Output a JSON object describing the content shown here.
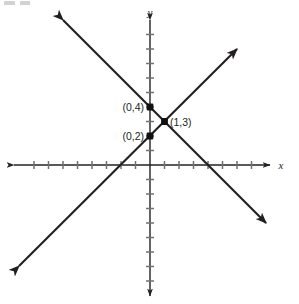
{
  "figure": {
    "kind": "coordinate-plane-graph",
    "width": 299,
    "height": 304,
    "background_color": "#ffffff",
    "line_color": "#231f20",
    "axis_color": "#222222",
    "tick_color": "#6f7173",
    "point_color": "#111111"
  },
  "axes": {
    "x_label": "x",
    "y_label": "y",
    "origin_px": {
      "x": 150,
      "y": 165
    },
    "unit_px": 14.5,
    "x_axis": {
      "pixel_start": 14,
      "pixel_end": 270,
      "tick_count_negative": 9,
      "tick_count_positive": 8,
      "arrows": "both"
    },
    "y_axis": {
      "pixel_start": 20,
      "pixel_end": 296,
      "tick_count_positive": 9,
      "tick_count_negative": 9,
      "arrows": "both"
    },
    "tick_half_length": 4,
    "gridlines": false,
    "tick_labels_shown": false
  },
  "chart_data": {
    "type": "line",
    "title": "",
    "xlabel": "x",
    "ylabel": "y",
    "xlim": [
      -9.4,
      8.3
    ],
    "ylim": [
      -9.6,
      10.0
    ],
    "grid": false,
    "legend": "none",
    "series": [
      {
        "name": "line-increasing",
        "slope": 1,
        "intercept": 2,
        "equation": "y = x + 2",
        "points": [
          [
            -9,
            -7
          ],
          [
            6,
            8
          ]
        ],
        "x": [
          -9,
          6
        ],
        "values": [
          -7,
          8
        ],
        "arrows": [
          "lower-left",
          "upper-right"
        ],
        "x_intercept": -2
      },
      {
        "name": "line-decreasing",
        "slope": -1,
        "intercept": 4,
        "equation": "y = -x + 4",
        "points": [
          [
            -6,
            10
          ],
          [
            8,
            -4
          ]
        ],
        "x": [
          -6,
          8
        ],
        "values": [
          10,
          -4
        ],
        "arrows": [
          "upper-left",
          "lower-right"
        ],
        "x_intercept": 4
      }
    ],
    "annotations": [
      {
        "label": "(0,4)",
        "x": 0,
        "y": 4,
        "text_anchor": "end"
      },
      {
        "label": "(0,2)",
        "x": 0,
        "y": 2,
        "text_anchor": "end"
      },
      {
        "label": "(1,3)",
        "x": 1,
        "y": 3,
        "text_anchor": "start"
      }
    ]
  },
  "points": [
    {
      "id": "point-0-4",
      "label": "(0,4)",
      "x": 0,
      "y": 4,
      "px": 150,
      "py": 107,
      "label_px": 145,
      "label_py": 111
    },
    {
      "id": "point-0-2",
      "label": "(0,2)",
      "x": 0,
      "y": 2,
      "px": 150,
      "py": 136,
      "label_px": 145,
      "label_py": 140
    },
    {
      "id": "point-1-3",
      "label": "(1,3)",
      "x": 1,
      "y": 3,
      "px": 164.5,
      "py": 121.5,
      "label_px": 170,
      "label_py": 126
    }
  ],
  "labels": {
    "point_0_4": "(0,4)",
    "point_0_2": "(0,2)",
    "point_1_3": "(1,3)",
    "axis_x": "x",
    "axis_y": "y"
  }
}
